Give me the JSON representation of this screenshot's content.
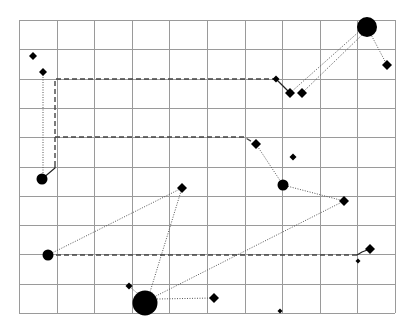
{
  "diagram": {
    "background": "#ffffff",
    "grid": {
      "x0": 19,
      "y0": 20,
      "x1": 395,
      "y1": 313,
      "cols": 10,
      "rows": 10,
      "line_color": "#9a9a9a"
    },
    "colors": {
      "node": "#000000",
      "dashed": "#444444",
      "dotted": "#555555",
      "solid": "#222222"
    },
    "nodes": [
      {
        "id": "d1",
        "shape": "diamond",
        "x": 33,
        "y": 56,
        "r": 4
      },
      {
        "id": "d2",
        "shape": "diamond",
        "x": 43,
        "y": 72,
        "r": 4
      },
      {
        "id": "c1",
        "shape": "circle",
        "x": 42,
        "y": 179,
        "r": 5.5
      },
      {
        "id": "c2",
        "shape": "circle",
        "x": 48,
        "y": 255,
        "r": 5.5
      },
      {
        "id": "d3",
        "shape": "diamond",
        "x": 182,
        "y": 188,
        "r": 5
      },
      {
        "id": "d4",
        "shape": "diamond",
        "x": 129,
        "y": 286,
        "r": 3.5
      },
      {
        "id": "c3",
        "shape": "circle",
        "x": 145,
        "y": 303,
        "r": 12.5
      },
      {
        "id": "d5",
        "shape": "diamond",
        "x": 214,
        "y": 298,
        "r": 5
      },
      {
        "id": "d6",
        "shape": "diamond",
        "x": 276,
        "y": 79,
        "r": 3.5
      },
      {
        "id": "d7",
        "shape": "diamond",
        "x": 290,
        "y": 93,
        "r": 5
      },
      {
        "id": "d8",
        "shape": "diamond",
        "x": 302,
        "y": 93,
        "r": 5
      },
      {
        "id": "c4",
        "shape": "circle",
        "x": 367,
        "y": 27,
        "r": 10
      },
      {
        "id": "d9",
        "shape": "diamond",
        "x": 387,
        "y": 65,
        "r": 5
      },
      {
        "id": "d10",
        "shape": "diamond",
        "x": 256,
        "y": 144,
        "r": 5
      },
      {
        "id": "d11",
        "shape": "diamond",
        "x": 293,
        "y": 157,
        "r": 3.5
      },
      {
        "id": "c5",
        "shape": "circle",
        "x": 283,
        "y": 185,
        "r": 5.5
      },
      {
        "id": "d12",
        "shape": "diamond",
        "x": 344,
        "y": 201,
        "r": 5
      },
      {
        "id": "d13",
        "shape": "diamond",
        "x": 370,
        "y": 249,
        "r": 5
      },
      {
        "id": "d14",
        "shape": "diamond",
        "x": 358,
        "y": 261,
        "r": 2.5
      },
      {
        "id": "d15",
        "shape": "diamond",
        "x": 280,
        "y": 311,
        "r": 2.5
      }
    ],
    "edges": [
      {
        "style": "dotted",
        "points": [
          [
            43,
            72
          ],
          [
            43,
            179
          ]
        ]
      },
      {
        "style": "solid",
        "points": [
          [
            42,
            179
          ],
          [
            55,
            168
          ],
          [
            55,
            166
          ]
        ]
      },
      {
        "style": "dashed",
        "points": [
          [
            55,
            166
          ],
          [
            55,
            79
          ],
          [
            276,
            79
          ]
        ]
      },
      {
        "style": "dashed",
        "points": [
          [
            55,
            137
          ],
          [
            244,
            137
          ],
          [
            256,
            144
          ]
        ]
      },
      {
        "style": "solid",
        "points": [
          [
            276,
            79
          ],
          [
            290,
            93
          ]
        ]
      },
      {
        "style": "dotted",
        "points": [
          [
            290,
            93
          ],
          [
            362,
            29
          ]
        ]
      },
      {
        "style": "dotted",
        "points": [
          [
            302,
            93
          ],
          [
            364,
            33
          ]
        ]
      },
      {
        "style": "dotted",
        "points": [
          [
            367,
            27
          ],
          [
            387,
            65
          ]
        ]
      },
      {
        "style": "dotted",
        "points": [
          [
            256,
            144
          ],
          [
            283,
            185
          ]
        ]
      },
      {
        "style": "dotted",
        "points": [
          [
            283,
            185
          ],
          [
            344,
            201
          ]
        ]
      },
      {
        "style": "dotted",
        "points": [
          [
            344,
            201
          ],
          [
            152,
            298
          ]
        ]
      },
      {
        "style": "dotted",
        "points": [
          [
            48,
            255
          ],
          [
            182,
            188
          ]
        ]
      },
      {
        "style": "dotted",
        "points": [
          [
            182,
            188
          ],
          [
            150,
            292
          ]
        ]
      },
      {
        "style": "dashed",
        "points": [
          [
            48,
            255
          ],
          [
            357,
            255
          ]
        ]
      },
      {
        "style": "solid",
        "points": [
          [
            357,
            255
          ],
          [
            362,
            252
          ],
          [
            370,
            249
          ]
        ]
      },
      {
        "style": "dotted",
        "points": [
          [
            157,
            299
          ],
          [
            214,
            298
          ]
        ]
      },
      {
        "style": "dotted",
        "points": [
          [
            129,
            286
          ],
          [
            137,
            293
          ]
        ]
      }
    ]
  }
}
